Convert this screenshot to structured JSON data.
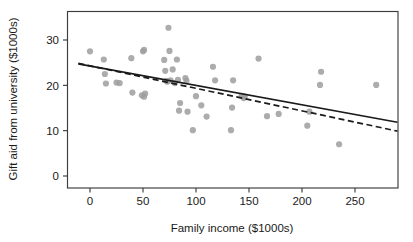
{
  "chart_data": {
    "type": "scatter",
    "title": "",
    "xlabel": "Family income ($1000s)",
    "ylabel": "Gift aid from university ($1000s)",
    "xlim": [
      -11,
      290
    ],
    "ylim": [
      -0.9,
      35.2
    ],
    "xticks": [
      0,
      50,
      100,
      150,
      200,
      250
    ],
    "xtick_labels": [
      "0",
      "50",
      "100",
      "150",
      "200",
      "250"
    ],
    "yticks": [
      0,
      10,
      20,
      30
    ],
    "ytick_labels": [
      "0",
      "10",
      "20",
      "30"
    ],
    "grid": false,
    "legend": "none",
    "point_color": "#9e9e9e",
    "point_radius": 3.1,
    "frame_color": "#3c3c3c",
    "points": [
      {
        "x": 0,
        "y": 27.5
      },
      {
        "x": 13,
        "y": 25.7
      },
      {
        "x": 14,
        "y": 22.5
      },
      {
        "x": 15,
        "y": 20.4
      },
      {
        "x": 25,
        "y": 20.6
      },
      {
        "x": 28,
        "y": 20.5
      },
      {
        "x": 39,
        "y": 26.0
      },
      {
        "x": 40,
        "y": 18.4
      },
      {
        "x": 49,
        "y": 17.8
      },
      {
        "x": 50,
        "y": 27.5
      },
      {
        "x": 51,
        "y": 27.8
      },
      {
        "x": 51,
        "y": 17.5
      },
      {
        "x": 52,
        "y": 18.2
      },
      {
        "x": 70,
        "y": 25.6
      },
      {
        "x": 71,
        "y": 23.2
      },
      {
        "x": 72,
        "y": 21.0
      },
      {
        "x": 73,
        "y": 20.8
      },
      {
        "x": 74,
        "y": 32.7
      },
      {
        "x": 75,
        "y": 27.6
      },
      {
        "x": 76,
        "y": 21.1
      },
      {
        "x": 78,
        "y": 23.5
      },
      {
        "x": 80,
        "y": 20.5
      },
      {
        "x": 82,
        "y": 25.7
      },
      {
        "x": 83,
        "y": 21.2
      },
      {
        "x": 84,
        "y": 14.4
      },
      {
        "x": 85,
        "y": 16.1
      },
      {
        "x": 90,
        "y": 21.6
      },
      {
        "x": 91,
        "y": 21.0
      },
      {
        "x": 92,
        "y": 14.2
      },
      {
        "x": 97,
        "y": 10.1
      },
      {
        "x": 100,
        "y": 17.6
      },
      {
        "x": 105,
        "y": 15.6
      },
      {
        "x": 110,
        "y": 13.1
      },
      {
        "x": 116,
        "y": 24.1
      },
      {
        "x": 118,
        "y": 21.1
      },
      {
        "x": 133,
        "y": 10.1
      },
      {
        "x": 134,
        "y": 15.1
      },
      {
        "x": 135,
        "y": 21.1
      },
      {
        "x": 143,
        "y": 17.7
      },
      {
        "x": 145,
        "y": 17.2
      },
      {
        "x": 146,
        "y": 17.5
      },
      {
        "x": 159,
        "y": 25.9
      },
      {
        "x": 167,
        "y": 13.2
      },
      {
        "x": 178,
        "y": 13.7
      },
      {
        "x": 205,
        "y": 11.1
      },
      {
        "x": 207,
        "y": 14.2
      },
      {
        "x": 217,
        "y": 20.1
      },
      {
        "x": 218,
        "y": 23.0
      },
      {
        "x": 235,
        "y": 7.0
      },
      {
        "x": 270,
        "y": 20.1
      }
    ],
    "lines": [
      {
        "name": "least-squares regression line",
        "style": "solid",
        "color": "#1a1a1a",
        "x1": -11,
        "y1": 24.75,
        "x2": 290,
        "y2": 11.85
      },
      {
        "name": "alternative fitted line",
        "style": "dashed",
        "color": "#1a1a1a",
        "x1": -11,
        "y1": 24.85,
        "x2": 290,
        "y2": 9.9
      }
    ]
  }
}
